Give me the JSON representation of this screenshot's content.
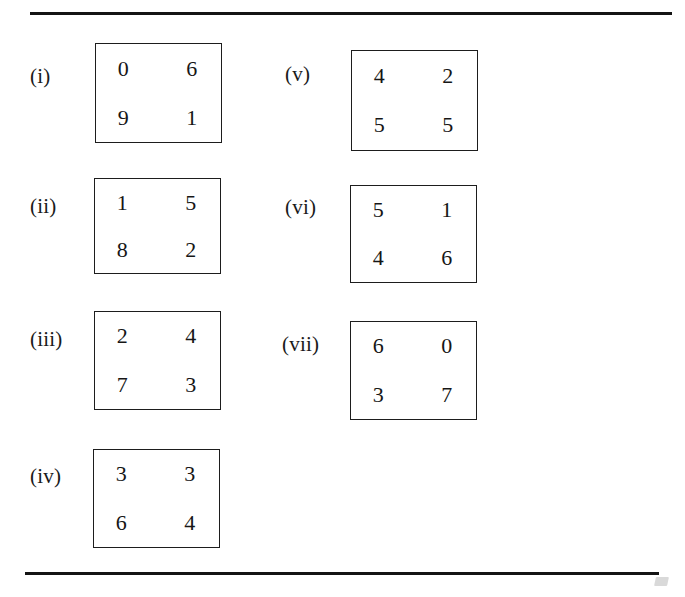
{
  "document": {
    "type": "matrix-figure-list",
    "background_color": "#ffffff",
    "ink_color": "#1a1a1a",
    "rules": {
      "top": {
        "x": 30,
        "y": 12,
        "width": 642,
        "height": 3
      },
      "bottom": {
        "x": 25,
        "y": 572,
        "width": 634,
        "height": 3
      }
    }
  },
  "columns": [
    {
      "name": "left-column",
      "items": [
        {
          "id": "i",
          "label": "(i)",
          "label_x": 30,
          "label_y": 66,
          "box": {
            "x": 95,
            "y": 43,
            "width": 127,
            "height": 100
          },
          "rows": [
            [
              "0",
              "6"
            ],
            [
              "9",
              "1"
            ]
          ]
        },
        {
          "id": "ii",
          "label": "(ii)",
          "label_x": 30,
          "label_y": 196,
          "box": {
            "x": 94,
            "y": 178,
            "width": 127,
            "height": 96
          },
          "rows": [
            [
              "1",
              "5"
            ],
            [
              "8",
              "2"
            ]
          ]
        },
        {
          "id": "iii",
          "label": "(iii)",
          "label_x": 30,
          "label_y": 329,
          "box": {
            "x": 94,
            "y": 311,
            "width": 127,
            "height": 99
          },
          "rows": [
            [
              "2",
              "4"
            ],
            [
              "7",
              "3"
            ]
          ]
        },
        {
          "id": "iv",
          "label": "(iv)",
          "label_x": 30,
          "label_y": 466,
          "box": {
            "x": 93,
            "y": 449,
            "width": 127,
            "height": 99
          },
          "rows": [
            [
              "3",
              "3"
            ],
            [
              "6",
              "4"
            ]
          ]
        }
      ]
    },
    {
      "name": "right-column",
      "items": [
        {
          "id": "v",
          "label": "(v)",
          "label_x": 285,
          "label_y": 64,
          "box": {
            "x": 351,
            "y": 50,
            "width": 127,
            "height": 101
          },
          "rows": [
            [
              "4",
              "2"
            ],
            [
              "5",
              "5"
            ]
          ]
        },
        {
          "id": "vi",
          "label": "(vi)",
          "label_x": 285,
          "label_y": 197,
          "box": {
            "x": 350,
            "y": 185,
            "width": 127,
            "height": 98
          },
          "rows": [
            [
              "5",
              "1"
            ],
            [
              "4",
              "6"
            ]
          ]
        },
        {
          "id": "vii",
          "label": "(vii)",
          "label_x": 282,
          "label_y": 334,
          "box": {
            "x": 350,
            "y": 321,
            "width": 127,
            "height": 99
          },
          "rows": [
            [
              "6",
              "0"
            ],
            [
              "3",
              "7"
            ]
          ]
        }
      ]
    }
  ]
}
